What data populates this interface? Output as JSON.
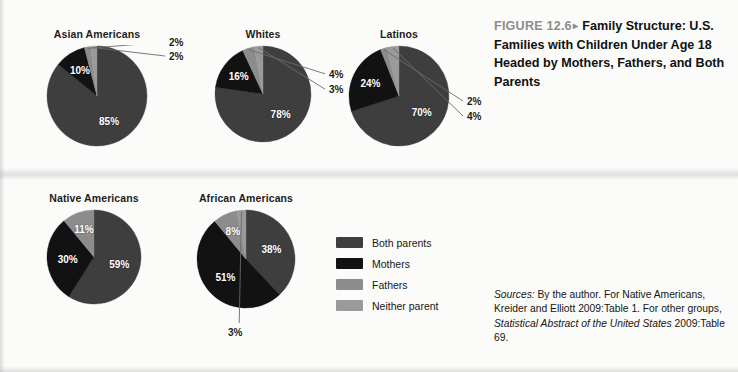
{
  "figure": {
    "number": "FIGURE 12.6",
    "arrow": "▸",
    "title": "Family Structure: U.S. Families with Children Under Age 18 Headed by Mothers, Fathers, and Both Parents"
  },
  "legend": {
    "items": [
      {
        "label": "Both parents",
        "color": "#3e3e3e"
      },
      {
        "label": "Mothers",
        "color": "#121212"
      },
      {
        "label": "Fathers",
        "color": "#8c8c8c"
      },
      {
        "label": "Neither parent",
        "color": "#9a9a9a"
      }
    ]
  },
  "sources": {
    "lead": "Sources:",
    "text_1": " By the author. For Native Americans, Kreider and Elliott 2009:Table 1. For other groups, ",
    "italic_title": "Statistical Abstract of the United States",
    "text_2": " 2009:Table 69."
  },
  "chart_data": [
    {
      "type": "pie",
      "title": "Asian Americans",
      "categories": [
        "Both parents",
        "Mothers",
        "Fathers",
        "Neither parent"
      ],
      "values": [
        85,
        10,
        2,
        2
      ],
      "labels": [
        "85%",
        "10%",
        "2%",
        "2%"
      ],
      "colors": [
        "#3e3e3e",
        "#121212",
        "#8c8c8c",
        "#9a9a9a"
      ],
      "label_placement": [
        "inside",
        "inside",
        "outside",
        "outside"
      ]
    },
    {
      "type": "pie",
      "title": "Whites",
      "categories": [
        "Both parents",
        "Mothers",
        "Fathers",
        "Neither parent"
      ],
      "values": [
        78,
        16,
        4,
        3
      ],
      "labels": [
        "78%",
        "16%",
        "4%",
        "3%"
      ],
      "colors": [
        "#3e3e3e",
        "#121212",
        "#8c8c8c",
        "#9a9a9a"
      ],
      "label_placement": [
        "inside",
        "inside",
        "outside",
        "outside"
      ]
    },
    {
      "type": "pie",
      "title": "Latinos",
      "categories": [
        "Both parents",
        "Mothers",
        "Fathers",
        "Neither parent"
      ],
      "values": [
        70,
        24,
        2,
        4
      ],
      "labels": [
        "70%",
        "24%",
        "2%",
        "4%"
      ],
      "colors": [
        "#3e3e3e",
        "#121212",
        "#8c8c8c",
        "#9a9a9a"
      ],
      "label_placement": [
        "inside",
        "inside",
        "outside",
        "outside"
      ]
    },
    {
      "type": "pie",
      "title": "Native Americans",
      "categories": [
        "Both parents",
        "Mothers",
        "Fathers",
        "Neither parent"
      ],
      "values": [
        59,
        30,
        11,
        0
      ],
      "labels": [
        "59%",
        "30%",
        "11%",
        ""
      ],
      "colors": [
        "#3e3e3e",
        "#121212",
        "#8c8c8c",
        "#9a9a9a"
      ],
      "label_placement": [
        "inside",
        "inside",
        "inside",
        "none"
      ]
    },
    {
      "type": "pie",
      "title": "African Americans",
      "categories": [
        "Both parents",
        "Mothers",
        "Fathers",
        "Neither parent"
      ],
      "values": [
        38,
        51,
        8,
        3
      ],
      "labels": [
        "38%",
        "51%",
        "8%",
        "3%"
      ],
      "colors": [
        "#3e3e3e",
        "#121212",
        "#8c8c8c",
        "#9a9a9a"
      ],
      "label_placement": [
        "inside",
        "inside",
        "inside",
        "outside"
      ]
    }
  ],
  "chart_layout": [
    {
      "left": 46,
      "top": 28,
      "radius": 50,
      "title_top": 0
    },
    {
      "left": 214,
      "top": 28,
      "radius": 48,
      "title_top": 0
    },
    {
      "left": 348,
      "top": 28,
      "radius": 50,
      "title_top": 0
    },
    {
      "left": 46,
      "top": 192,
      "radius": 47,
      "title_top": 0
    },
    {
      "left": 196,
      "top": 192,
      "radius": 49,
      "title_top": 0
    }
  ]
}
